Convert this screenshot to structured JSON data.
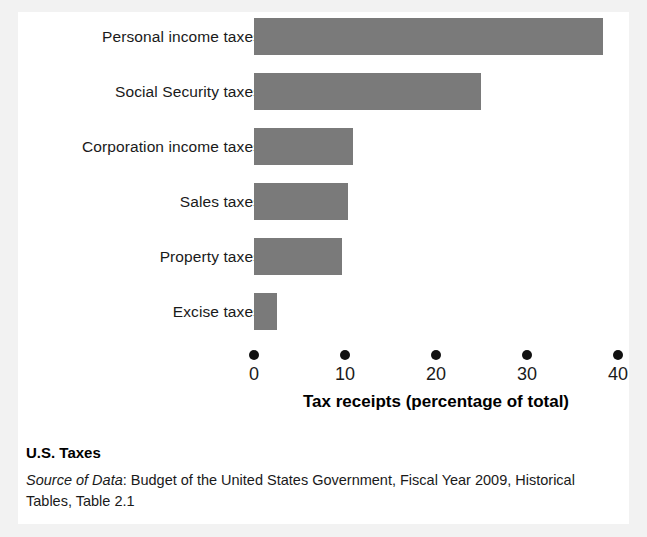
{
  "figure": {
    "caption_title": "U.S. Taxes",
    "source_label": "Source of Data",
    "source_separator": ": ",
    "source_text": "Budget of the United States Government, Fiscal Year 2009, Historical Tables, Table 2.1",
    "bar_color": "#7a7a7a",
    "tick_color": "#111111",
    "background_color": "#ffffff",
    "page_color": "#f2f2f2"
  },
  "chart_data": {
    "type": "bar",
    "orientation": "horizontal",
    "title": "",
    "subtitle": "",
    "xlabel": "Tax receipts (percentage of total)",
    "ylabel": "",
    "categories": [
      "Personal income taxes",
      "Social Security taxes",
      "Corporation income taxes",
      "Sales taxes",
      "Property taxes",
      "Excise taxes"
    ],
    "values": [
      38.4,
      24.9,
      10.9,
      10.3,
      9.7,
      2.5
    ],
    "xlim": [
      0,
      40
    ],
    "xticks": [
      0,
      10,
      20,
      30,
      40
    ],
    "xtick_labels": [
      "0",
      "10",
      "20",
      "30",
      "40"
    ],
    "grid": false,
    "legend": false,
    "legend_position": "none",
    "units": "percent of total"
  }
}
